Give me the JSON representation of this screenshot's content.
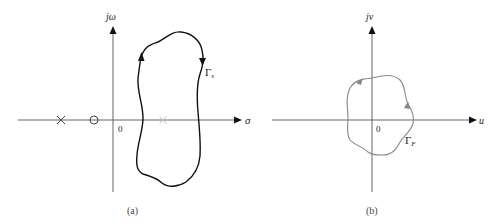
{
  "figure": {
    "panel_a": {
      "caption": "(a)",
      "x_axis_label": "σ",
      "y_axis_label": "jω",
      "origin_label": "0",
      "contour_label_main": "Γ",
      "contour_label_sub": "s",
      "markers": [
        {
          "type": "pole",
          "symbol": "×",
          "position": "left of origin, far",
          "color": "#444444"
        },
        {
          "type": "zero",
          "symbol": "○",
          "position": "left of origin, near",
          "color": "#444444"
        },
        {
          "type": "pole",
          "symbol": "×",
          "position": "right of origin, inside contour",
          "color": "#aaaaaa"
        }
      ],
      "contour_color": "#111111",
      "contour_direction": "clockwise"
    },
    "panel_b": {
      "caption": "(b)",
      "x_axis_label": "u",
      "y_axis_label": "jv",
      "origin_label": "0",
      "contour_label_main": "Γ",
      "contour_label_sub": "F",
      "contour_color": "#888888",
      "contour_direction": "counterclockwise"
    },
    "axis_color": "#444444"
  }
}
